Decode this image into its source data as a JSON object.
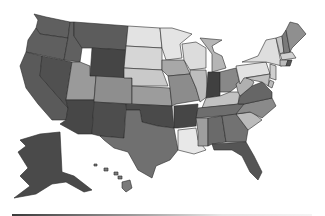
{
  "map": {
    "type": "choropleth",
    "region": "United States",
    "palette": {
      "darkest": "#3f3f3f",
      "dark": "#555555",
      "mid_dark": "#6a6a6a",
      "mid": "#8a8a8a",
      "mid_light": "#a9a9a9",
      "light": "#c8c8c8",
      "lightest": "#e6e6e6"
    },
    "states": {
      "WA": "#5f5f5f",
      "OR": "#5f5f5f",
      "CA": "#5a5a5a",
      "NV": "#505050",
      "ID": "#606060",
      "MT": "#5c5c5c",
      "WY": "#454545",
      "UT": "#9a9a9a",
      "AZ": "#474747",
      "CO": "#8e8e8e",
      "NM": "#4d4d4d",
      "ND": "#e3e3e3",
      "SD": "#d6d6d6",
      "NE": "#c9c9c9",
      "KS": "#9c9c9c",
      "OK": "#4a4a4a",
      "TX": "#707070",
      "MN": "#e4e4e4",
      "IA": "#a8a8a8",
      "MO": "#8c8c8c",
      "AR": "#464646",
      "LA": "#e8e8e8",
      "WI": "#dcdcdc",
      "IL": "#bdbdbd",
      "MI": "#b5b5b5",
      "IN": "#404040",
      "OH": "#888888",
      "KY": "#c2c2c2",
      "TN": "#6e6e6e",
      "MS": "#9e9e9e",
      "AL": "#6a6a6a",
      "GA": "#727272",
      "FL": "#555555",
      "SC": "#bbbbbb",
      "NC": "#8a8a8a",
      "VA": "#666666",
      "WV": "#b0b0b0",
      "PA": "#e2e2e2",
      "NY": "#dedede",
      "ME": "#8f8f8f",
      "NH": "#7a7a7a",
      "VT": "#c4c4c4",
      "MA": "#d0d0d0",
      "CT": "#bcbcbc",
      "RI": "#555555",
      "NJ": "#cfcfcf",
      "DE": "#bbbbbb",
      "MD": "#c0c0c0",
      "AK": "#4a4a4a",
      "HI": "#7a7a7a"
    },
    "legend": {
      "gradient_from": "#3a3a3a",
      "gradient_to": "#f4f4f4"
    }
  }
}
